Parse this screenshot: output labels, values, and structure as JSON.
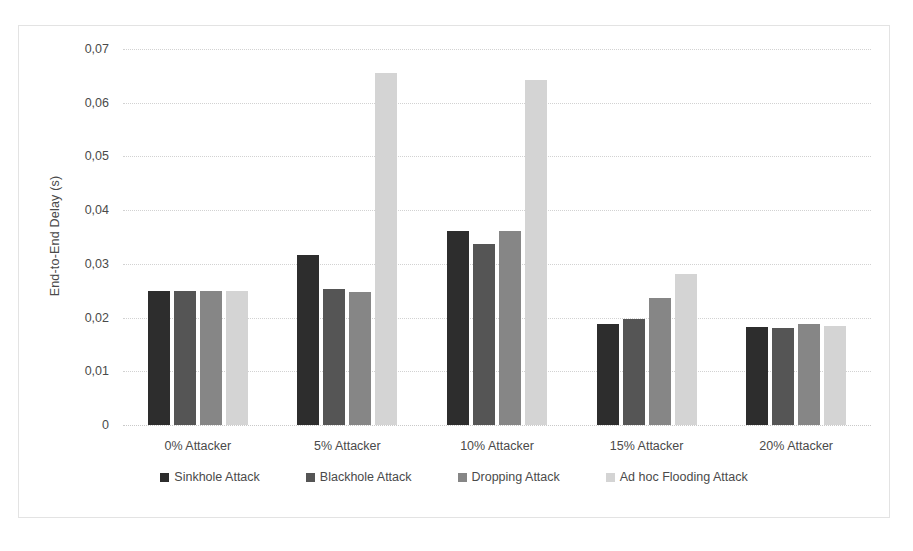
{
  "chart_data": {
    "type": "bar",
    "title": "",
    "xlabel": "",
    "ylabel": "End-to-End Delay (s)",
    "ylim": [
      0,
      0.07
    ],
    "ytick_labels": [
      "0,07",
      "0,06",
      "0,05",
      "0,04",
      "0,03",
      "0,02",
      "0,01",
      "0"
    ],
    "ytick_values": [
      0.07,
      0.06,
      0.05,
      0.04,
      0.03,
      0.02,
      0.01,
      0
    ],
    "grid": true,
    "legend_position": "bottom",
    "categories": [
      "0% Attacker",
      "5% Attacker",
      "10% Attacker",
      "15% Attacker",
      "20% Attacker"
    ],
    "series": [
      {
        "name": "Sinkhole Attack",
        "color": "#2d2d2d",
        "values": [
          0.025,
          0.0317,
          0.0361,
          0.0188,
          0.0183
        ]
      },
      {
        "name": "Blackhole Attack",
        "color": "#555555",
        "values": [
          0.025,
          0.0253,
          0.0337,
          0.0197,
          0.0181
        ]
      },
      {
        "name": "Dropping Attack",
        "color": "#868686",
        "values": [
          0.025,
          0.0248,
          0.0361,
          0.0237,
          0.0188
        ]
      },
      {
        "name": "Ad hoc Flooding Attack",
        "color": "#d4d4d4",
        "values": [
          0.025,
          0.0655,
          0.0642,
          0.0281,
          0.0184
        ]
      }
    ]
  }
}
